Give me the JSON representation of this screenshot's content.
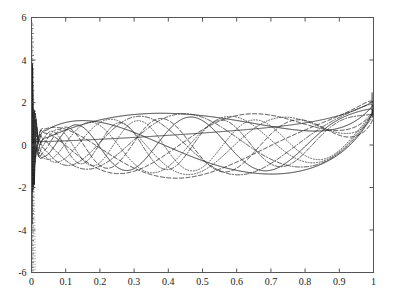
{
  "chart_data": {
    "type": "line",
    "title": "",
    "subtitle": "",
    "xlabel": "",
    "ylabel": "",
    "xlim": [
      0,
      1
    ],
    "ylim": [
      -6,
      6
    ],
    "grid": false,
    "legend": null,
    "legend_position": "none",
    "xticks": [
      0,
      0.1,
      0.2,
      0.3,
      0.4,
      0.5,
      0.6,
      0.7,
      0.8,
      0.9,
      1
    ],
    "xticklabels": [
      "0",
      "0.1",
      "0.2",
      "0.3",
      "0.4",
      "0.5",
      "0.6",
      "0.7",
      "0.8",
      "0.9",
      "1"
    ],
    "yticks": [
      -6,
      -4,
      -2,
      0,
      2,
      4,
      6
    ],
    "yticklabels": [
      "-6",
      "-4",
      "-2",
      "0",
      "2",
      "4",
      "6"
    ],
    "axes_box": true,
    "tick_direction": "in",
    "background": "#ffffff",
    "axis_color": "#555555",
    "series": [
      {
        "name": "mode-1",
        "style": "solid",
        "color": "#1a1a1a",
        "width": 0.9,
        "k": 1.0,
        "decay": 0.55,
        "amp": 1.55,
        "phase": 0.0,
        "edge_amp": 5.6,
        "right_amp": 1.9
      },
      {
        "name": "mode-2",
        "style": "solid",
        "color": "#1a1a1a",
        "width": 0.9,
        "k": 1.6,
        "decay": 0.6,
        "amp": 1.6,
        "phase": 0.35,
        "edge_amp": 5.2,
        "right_amp": 1.85
      },
      {
        "name": "mode-3",
        "style": "dashed",
        "color": "#2a2a2a",
        "width": 0.9,
        "k": 2.2,
        "decay": 0.65,
        "amp": 1.58,
        "phase": 0.7,
        "edge_amp": 4.8,
        "right_amp": 1.8
      },
      {
        "name": "mode-4",
        "style": "dashed",
        "color": "#2a2a2a",
        "width": 0.9,
        "k": 2.8,
        "decay": 0.7,
        "amp": 1.52,
        "phase": 1.05,
        "edge_amp": 4.4,
        "right_amp": 1.75
      },
      {
        "name": "mode-5",
        "style": "dashdot",
        "color": "#333333",
        "width": 0.9,
        "k": 3.4,
        "decay": 0.75,
        "amp": 1.48,
        "phase": 1.4,
        "edge_amp": 4.0,
        "right_amp": 1.7
      },
      {
        "name": "mode-6",
        "style": "dashdot",
        "color": "#333333",
        "width": 0.9,
        "k": 4.0,
        "decay": 0.8,
        "amp": 1.44,
        "phase": 1.75,
        "edge_amp": 3.6,
        "right_amp": 1.65
      },
      {
        "name": "mode-7",
        "style": "dotted",
        "color": "#3d3d3d",
        "width": 0.9,
        "k": 4.6,
        "decay": 0.85,
        "amp": 1.4,
        "phase": 2.1,
        "edge_amp": 3.2,
        "right_amp": 1.6
      },
      {
        "name": "mode-8",
        "style": "dotted",
        "color": "#3d3d3d",
        "width": 0.9,
        "k": 5.2,
        "decay": 0.9,
        "amp": 1.36,
        "phase": 2.45,
        "edge_amp": 2.9,
        "right_amp": 1.55
      },
      {
        "name": "mode-9",
        "style": "solid",
        "color": "#262626",
        "width": 0.9,
        "k": 5.8,
        "decay": 0.95,
        "amp": 1.32,
        "phase": 2.8,
        "edge_amp": 2.6,
        "right_amp": 1.5
      },
      {
        "name": "mode-10",
        "style": "dashed",
        "color": "#2e2e2e",
        "width": 0.9,
        "k": 6.4,
        "decay": 1.0,
        "amp": 1.28,
        "phase": 3.15,
        "edge_amp": 2.3,
        "right_amp": 1.45
      },
      {
        "name": "mode-11",
        "style": "dotted",
        "color": "#444444",
        "width": 0.9,
        "k": 7.0,
        "decay": 1.05,
        "amp": 1.22,
        "phase": 3.5,
        "edge_amp": 2.0,
        "right_amp": 1.4
      },
      {
        "name": "mode-12",
        "style": "dashdot",
        "color": "#383838",
        "width": 0.9,
        "k": 7.6,
        "decay": 1.1,
        "amp": 1.18,
        "phase": 3.85,
        "edge_amp": 1.8,
        "right_amp": 1.35
      },
      {
        "name": "envelope-upper",
        "style": "solid",
        "color": "#1a1a1a",
        "width": 0.8,
        "k": 0.0,
        "decay": 0.0,
        "amp": 0.0,
        "phase": 0.0,
        "edge_amp": 0.0,
        "right_amp": 0.0
      }
    ],
    "singular_edge": {
      "x": 0.0,
      "y_min": -6,
      "y_max": 5.8,
      "note": "dense near-vertical oscillation column at the left boundary"
    },
    "right_edge": {
      "x": 1.0,
      "y_converge": 2.0,
      "note": "all curves sweep upward to about y = 2 at x = 1"
    }
  },
  "axes": {
    "x_tick_labels": [
      "0",
      "0.1",
      "0.2",
      "0.3",
      "0.4",
      "0.5",
      "0.6",
      "0.7",
      "0.8",
      "0.9",
      "1"
    ],
    "y_tick_labels": [
      "6",
      "4",
      "2",
      "0",
      "-2",
      "-4",
      "-6"
    ]
  }
}
